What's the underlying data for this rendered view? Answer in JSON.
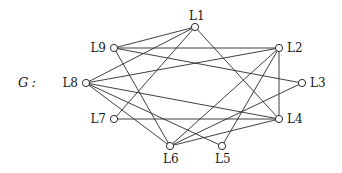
{
  "graph": {
    "name": "G",
    "name_suffix": ":",
    "nodes": [
      {
        "id": "L1",
        "label": "L1",
        "x": 195,
        "y": 27,
        "lx": 189,
        "ly": 20,
        "anchor": "start"
      },
      {
        "id": "L2",
        "label": "L2",
        "x": 279,
        "y": 48,
        "lx": 287,
        "ly": 52,
        "anchor": "start"
      },
      {
        "id": "L3",
        "label": "L3",
        "x": 302,
        "y": 83,
        "lx": 310,
        "ly": 87,
        "anchor": "start"
      },
      {
        "id": "L4",
        "label": "L4",
        "x": 279,
        "y": 119,
        "lx": 287,
        "ly": 123,
        "anchor": "start"
      },
      {
        "id": "L5",
        "label": "L5",
        "x": 222,
        "y": 146,
        "lx": 215,
        "ly": 163,
        "anchor": "start"
      },
      {
        "id": "L6",
        "label": "L6",
        "x": 170,
        "y": 146,
        "lx": 163,
        "ly": 163,
        "anchor": "start"
      },
      {
        "id": "L7",
        "label": "L7",
        "x": 114,
        "y": 119,
        "lx": 106,
        "ly": 123,
        "anchor": "end"
      },
      {
        "id": "L8",
        "label": "L8",
        "x": 86,
        "y": 83,
        "lx": 78,
        "ly": 87,
        "anchor": "end"
      },
      {
        "id": "L9",
        "label": "L9",
        "x": 114,
        "y": 48,
        "lx": 106,
        "ly": 52,
        "anchor": "end"
      }
    ],
    "edges": [
      [
        "L9",
        "L1"
      ],
      [
        "L9",
        "L2"
      ],
      [
        "L9",
        "L3"
      ],
      [
        "L9",
        "L6"
      ],
      [
        "L8",
        "L1"
      ],
      [
        "L8",
        "L2"
      ],
      [
        "L8",
        "L4"
      ],
      [
        "L8",
        "L5"
      ],
      [
        "L8",
        "L6"
      ],
      [
        "L7",
        "L1"
      ],
      [
        "L7",
        "L4"
      ],
      [
        "L1",
        "L4"
      ],
      [
        "L2",
        "L4"
      ],
      [
        "L2",
        "L6"
      ],
      [
        "L2",
        "L5"
      ],
      [
        "L3",
        "L6"
      ],
      [
        "L4",
        "L6"
      ]
    ]
  }
}
